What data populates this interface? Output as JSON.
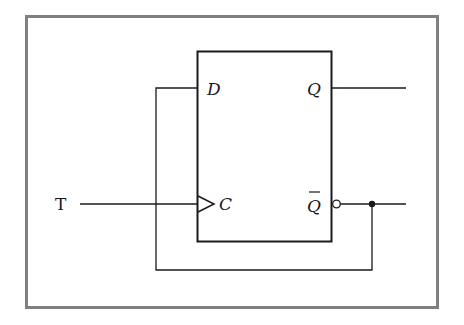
{
  "diagram": {
    "type": "circuit-schematic",
    "input_label": "T",
    "flipflop": {
      "pins": {
        "d": "D",
        "clock": "C",
        "q": "Q",
        "q_bar": "Q"
      },
      "q_bar_overbar": true,
      "clock_edge_triangle": true,
      "q_bar_inversion_bubble": true
    },
    "connections": [
      {
        "from": "T",
        "to": "C"
      },
      {
        "from": "Q_bar",
        "to": "D",
        "note": "feedback loop"
      },
      {
        "from": "Q",
        "to": "output"
      },
      {
        "from": "Q_bar",
        "to": "output"
      }
    ],
    "colors": {
      "frame": "#808080",
      "lines": "#1a1a1a",
      "background": "#ffffff"
    }
  }
}
